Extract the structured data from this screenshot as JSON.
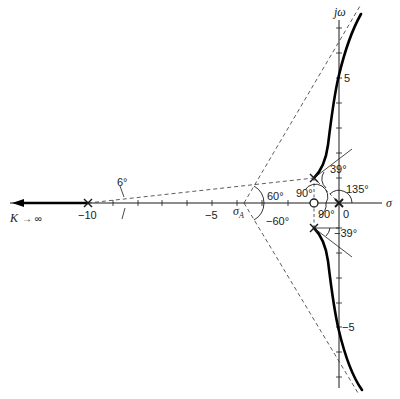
{
  "diagram": {
    "type": "root-locus",
    "axes": {
      "real_axis_label": "σ",
      "imag_axis_label": "jω",
      "x_ticks": [
        -10,
        -9,
        -8,
        -7,
        -6,
        -5,
        -4,
        -3,
        -2,
        -1,
        0
      ],
      "x_tick_labels": {
        "neg10": "−10",
        "neg5": "−5",
        "zero": "0"
      },
      "y_tick_labels": {
        "pos5": "5",
        "neg5": "−5"
      }
    },
    "poles": [
      {
        "re": -10,
        "im": 0,
        "symbol": "×"
      },
      {
        "re": -1,
        "im": 1,
        "symbol": "×"
      },
      {
        "re": -1,
        "im": -1,
        "symbol": "×"
      },
      {
        "re": 0,
        "im": 0,
        "symbol": "× (double)"
      }
    ],
    "zeros": [
      {
        "re": -1,
        "im": 0,
        "symbol": "○"
      }
    ],
    "asymptote_centroid_label": "σ",
    "asymptote_centroid_sub": "A",
    "angles": {
      "asym_upper": "60°",
      "asym_lower": "−60°",
      "pole_minus10": "6°",
      "departure_upper": "39°",
      "departure_lower": "−39°",
      "zero_to_upper_pole": "90°",
      "zero_to_lower_pole": "90°",
      "origin_angle": "135°"
    },
    "annotations": {
      "k_label": "K",
      "k_arrow": "→ ∞"
    }
  }
}
